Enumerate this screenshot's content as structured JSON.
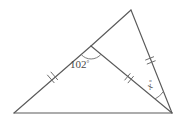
{
  "figure": {
    "type": "geometry-diagram",
    "background_color": "#ffffff",
    "line_color": "#5a5a5a",
    "mark_color": "#6e6e6e",
    "text_color": "#4a4a4a",
    "points": {
      "A": {
        "name": "bottom-left-vertex",
        "x": 14,
        "y": 113
      },
      "B": {
        "name": "top-apex-vertex",
        "x": 131,
        "y": 10
      },
      "C": {
        "name": "bottom-right-vertex",
        "x": 172,
        "y": 113
      },
      "D": {
        "name": "upper-left-interior-point",
        "x": 91,
        "y": 46
      }
    },
    "segments": [
      {
        "name": "base-A-C",
        "from": "A",
        "to": "C",
        "ticks": 0
      },
      {
        "name": "side-A-D",
        "from": "A",
        "to": "D",
        "ticks": 2
      },
      {
        "name": "side-D-B",
        "from": "D",
        "to": "B",
        "ticks": 0
      },
      {
        "name": "cevian-D-C",
        "from": "D",
        "to": "C",
        "ticks": 2
      },
      {
        "name": "side-B-C",
        "from": "B",
        "to": "C",
        "ticks": 2
      }
    ],
    "angles": [
      {
        "name": "angle-at-D",
        "vertex": "D",
        "label": "102",
        "degree_symbol": "°",
        "label_x": 70,
        "label_y": 68,
        "arc_radius": 13
      },
      {
        "name": "angle-at-C",
        "vertex": "C",
        "label": "x",
        "degree_symbol": "°",
        "label_x": 150,
        "label_y": 90,
        "arc_radius": 22
      }
    ]
  }
}
